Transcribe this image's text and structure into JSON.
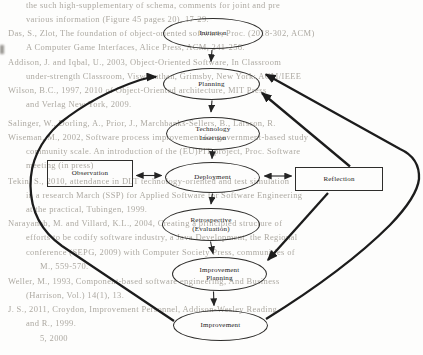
{
  "diagram": {
    "type": "process-flow-diagram",
    "nodes": {
      "initiation": {
        "label": "Initiation",
        "shape": "ellipse"
      },
      "planning": {
        "label": "Planning",
        "shape": "ellipse"
      },
      "technology_insertion": {
        "label": "Technology\nInsertion",
        "shape": "ellipse"
      },
      "deployment": {
        "label": "Deployment",
        "shape": "ellipse"
      },
      "retrospective": {
        "label": "Retrospective\n(Evaluation)",
        "shape": "ellipse"
      },
      "improvement_planning": {
        "label": "Improvement\nPlanning",
        "shape": "ellipse"
      },
      "improvement": {
        "label": "Improvement",
        "shape": "ellipse"
      },
      "observation": {
        "label": "Observation",
        "shape": "rectangle"
      },
      "reflection": {
        "label": "Reflection",
        "shape": "rectangle"
      }
    },
    "edges": [
      {
        "from": "Initiation",
        "to": "Planning",
        "style": "thin-arrow"
      },
      {
        "from": "Planning",
        "to": "Technology Insertion",
        "style": "thin-arrow"
      },
      {
        "from": "Technology Insertion",
        "to": "Deployment",
        "style": "thin-arrow"
      },
      {
        "from": "Deployment",
        "to": "Retrospective (Evaluation)",
        "style": "thin-arrow"
      },
      {
        "from": "Retrospective (Evaluation)",
        "to": "Improvement Planning",
        "style": "thin-arrow"
      },
      {
        "from": "Improvement Planning",
        "to": "Improvement",
        "style": "thin-arrow"
      },
      {
        "from": "Observation",
        "to": "Deployment",
        "style": "thin-double-arrow"
      },
      {
        "from": "Deployment",
        "to": "Reflection",
        "style": "thin-double-arrow"
      },
      {
        "from": "Improvement",
        "to": "Planning",
        "style": "thick-curve-left"
      },
      {
        "from": "Improvement",
        "to": "Planning",
        "style": "thick-curve-right"
      },
      {
        "from": "Reflection",
        "to": "Planning",
        "style": "thick-line"
      },
      {
        "from": "Reflection",
        "to": "Improvement Planning",
        "style": "thick-line"
      }
    ]
  },
  "colors": {
    "background": "#fdfdfc",
    "diagram_line": "#1c1c1c",
    "node_border": "#2e2d2b",
    "bleed_text": "#a5a199"
  },
  "background_bleed": {
    "description": "illegible blurred reference text bleeding through the scanned page",
    "lines": [
      {
        "x": 26,
        "y": 0,
        "text": "the such high-supplementary of schema, comments for joint and pre"
      },
      {
        "x": 26,
        "y": 14,
        "text": "various information (Figure 45 pages 20), 17-29."
      },
      {
        "x": 8,
        "y": 28,
        "text": "Das, S., Zlot, The foundation of object-oriented software, Proc. (2018-302, ACM)"
      },
      {
        "x": 26,
        "y": 42,
        "text": "A Computer Game Interfaces, Alice Press, ACM, 241-256."
      },
      {
        "x": 8,
        "y": 57,
        "text": "Addison, J. and Iqbal, U., 2003, Object-Oriented Software, In Classroom"
      },
      {
        "x": 26,
        "y": 71,
        "text": "under-strength Classroom, Viswanathan, Grimsby, New York: ACM/IEEE"
      },
      {
        "x": 8,
        "y": 85,
        "text": "Wilson, B.C., 1997, 2010 of Object-Oriented architecture, MIT Press"
      },
      {
        "x": 26,
        "y": 99,
        "text": "and Verlag New York, 2009."
      },
      {
        "x": 8,
        "y": 118,
        "text": "Salinger, W., Dorling, A., Prior, J., Marchbanks-Sellers, B., Larsson, R."
      },
      {
        "x": 8,
        "y": 132,
        "text": "Wiseman, M., 2002, Software process improvement for government-based study"
      },
      {
        "x": 26,
        "y": 146,
        "text": "community scale. An introduction of the (EU)PIT project, Proc. Software"
      },
      {
        "x": 26,
        "y": 160,
        "text": "meeting (in press)"
      },
      {
        "x": 8,
        "y": 176,
        "text": "Tekin, S., 2010, attendance in DLT technology-oriented and test simulation"
      },
      {
        "x": 26,
        "y": 190,
        "text": "in a research March (SSP) for Applied Software for Software Engineering"
      },
      {
        "x": 26,
        "y": 204,
        "text": "at the practical, Tubingen, 1999."
      },
      {
        "x": 8,
        "y": 218,
        "text": "Narayanab, M. and Villard, K.L., 2004, Creating a principled structure of"
      },
      {
        "x": 26,
        "y": 232,
        "text": "efforts to be codify software industry, a Java Development, the Regional"
      },
      {
        "x": 26,
        "y": 247,
        "text": "conference (SEPG, 2009) with Computer Society Press, communities of"
      },
      {
        "x": 40,
        "y": 261,
        "text": "M., 559-570."
      },
      {
        "x": 8,
        "y": 276,
        "text": "Weller, M., 1993, Component-based software engineering, And Business"
      },
      {
        "x": 26,
        "y": 290,
        "text": "(Harrison, Vol.) 14(1), 13."
      },
      {
        "x": 8,
        "y": 304,
        "text": "J. S., 2011, Croydon, Improvement Personnel, Addison-Wesley Reading"
      },
      {
        "x": 26,
        "y": 318,
        "text": "and R., 1999."
      },
      {
        "x": 40,
        "y": 333,
        "text": "5, 2000"
      }
    ]
  }
}
